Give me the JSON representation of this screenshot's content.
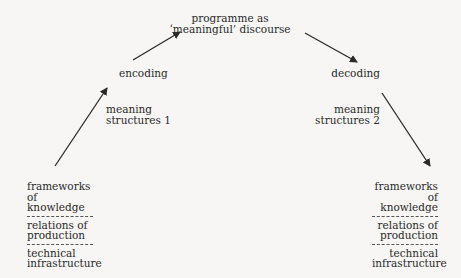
{
  "diagram": {
    "top": {
      "line1": "programme as",
      "line2": "‘meaningful’ discourse"
    },
    "encoding": "encoding",
    "decoding": "decoding",
    "meaning_structures_1": {
      "line1": "meaning",
      "line2": "structures 1"
    },
    "meaning_structures_2": {
      "line1": "meaning",
      "line2": "structures 2"
    },
    "left_block": [
      {
        "line1": "frameworks",
        "line2": "of knowledge"
      },
      {
        "line1": "relations of",
        "line2": "production"
      },
      {
        "line1": "technical",
        "line2": "infrastructure"
      }
    ],
    "right_block": [
      {
        "line1": "frameworks",
        "line2": "of knowledge"
      },
      {
        "line1": "relations of",
        "line2": "production"
      },
      {
        "line1": "technical",
        "line2": "infrastructure"
      }
    ],
    "arrows": [
      {
        "name": "left-up-arrow",
        "from": [
          55,
          166
        ],
        "to": [
          107,
          88
        ]
      },
      {
        "name": "encoding-to-programme-arrow",
        "from": [
          133,
          60
        ],
        "to": [
          180,
          32
        ]
      },
      {
        "name": "programme-to-decoding-arrow",
        "from": [
          305,
          33
        ],
        "to": [
          357,
          62
        ]
      },
      {
        "name": "right-down-arrow",
        "from": [
          382,
          93
        ],
        "to": [
          430,
          166
        ]
      }
    ],
    "colors": {
      "background": "#f7f6f4",
      "ink": "#2a2a2a"
    }
  }
}
